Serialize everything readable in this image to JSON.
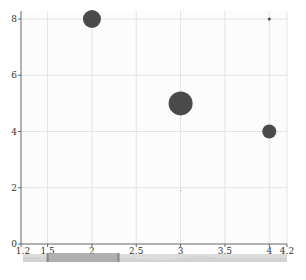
{
  "chart_data": {
    "type": "scatter",
    "subtype": "bubble",
    "title": "",
    "xlabel": "",
    "ylabel": "",
    "xlim": [
      1.2,
      4.2
    ],
    "ylim": [
      0,
      8
    ],
    "x_ticks": [
      "1.2",
      "1.5",
      "2",
      "2.5",
      "3",
      "3.5",
      "4",
      "4.2"
    ],
    "x_tick_values": [
      1.2,
      1.5,
      2,
      2.5,
      3,
      3.5,
      4,
      4.2
    ],
    "y_ticks": [
      "0",
      "2",
      "4",
      "6",
      "8"
    ],
    "y_tick_values": [
      0,
      2,
      4,
      6,
      8
    ],
    "grid": true,
    "legend": null,
    "series": [
      {
        "name": "",
        "color": "#4a4a4a",
        "points": [
          {
            "x": 2,
            "y": 8,
            "size": 9
          },
          {
            "x": 3,
            "y": 5,
            "size": 12
          },
          {
            "x": 4,
            "y": 4,
            "size": 7
          },
          {
            "x": 4,
            "y": 8,
            "size": 1.5
          },
          {
            "x": 3,
            "y": 1.9,
            "size": 0.6
          }
        ]
      }
    ],
    "data_zoom": {
      "type": "slider",
      "start": 1.5,
      "end": 2.3
    }
  },
  "colors": {
    "bubble": "#4a4a4a",
    "axis": "#666666",
    "grid": "#e3e3e3",
    "slider_track": "#dcdcdc",
    "slider_selected": "#a8a8a8"
  }
}
